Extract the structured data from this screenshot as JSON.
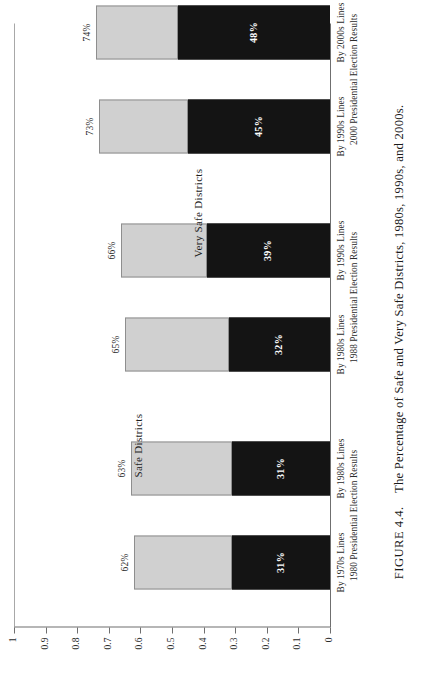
{
  "figure": {
    "caption_label": "FIGURE 4.4.",
    "caption_text": "The Percentage of Safe and Very Safe Districts, 1980s, 1990s, and 2000s."
  },
  "annotations": {
    "safe": "Safe Districts",
    "very_safe": "Very Safe Districts"
  },
  "colors": {
    "safe_fill": "#d0d0d0",
    "safe_stroke": "#8e8e8e",
    "very_safe_fill": "#141414",
    "axis": "#6f6f6f",
    "background": "#ffffff",
    "text": "#1a1a1a"
  },
  "chart_data": {
    "type": "bar",
    "title": "",
    "subtitle": "",
    "xlabel": "",
    "ylabel": "",
    "ylim": [
      0,
      1
    ],
    "ytick_labels": [
      "0",
      "0.1",
      "0.2",
      "0.3",
      "0.4",
      "0.5",
      "0.6",
      "0.7",
      "0.8",
      "0.9",
      "1"
    ],
    "ytick_values": [
      0,
      0.1,
      0.2,
      0.3,
      0.4,
      0.5,
      0.6,
      0.7,
      0.8,
      0.9,
      1
    ],
    "grid": false,
    "legend_position": "in-plot annotations",
    "orientation": "stacked-vertical",
    "categories": [
      "By 1970s Lines",
      "By 1980s Lines",
      "By 1980s Lines",
      "By 1990s Lines",
      "By 1990s Lines",
      "By 2000s Lines"
    ],
    "group_labels": [
      "1980 Presidential Election Results",
      "1988 Presidential Election Results",
      "2000 Presidential Election Results"
    ],
    "series": [
      {
        "name": "Very Safe Districts",
        "values": [
          0.31,
          0.31,
          0.32,
          0.39,
          0.45,
          0.48
        ],
        "data_labels": [
          "31%",
          "31%",
          "32%",
          "39%",
          "45%",
          "48%"
        ]
      },
      {
        "name": "Safe Districts",
        "values": [
          0.62,
          0.63,
          0.65,
          0.66,
          0.73,
          0.74
        ],
        "data_labels": [
          "62%",
          "63%",
          "65%",
          "66%",
          "73%",
          "74%"
        ],
        "note": "values are cumulative totals (top of stacked bar)"
      }
    ]
  }
}
